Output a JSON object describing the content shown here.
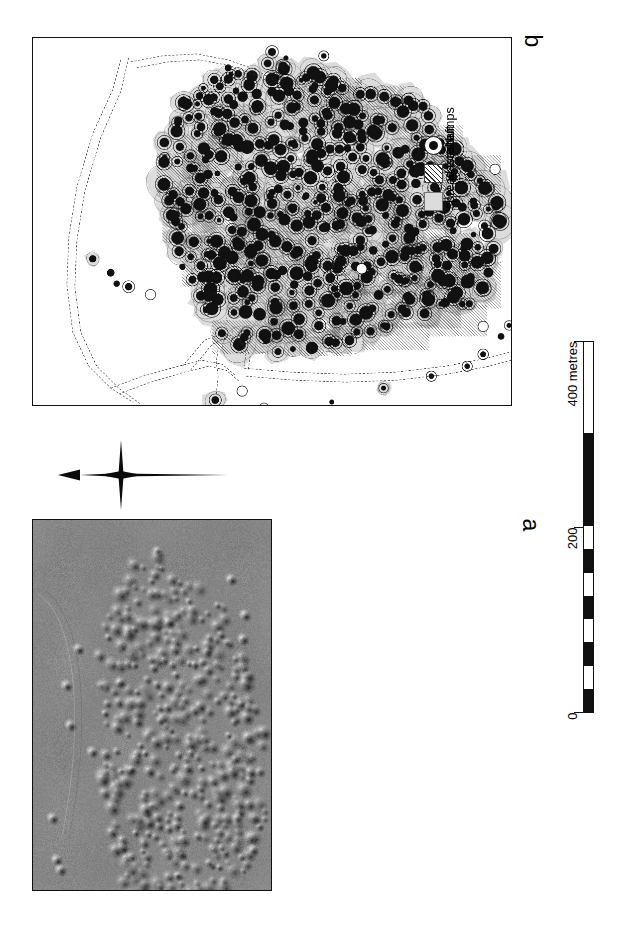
{
  "figure": {
    "panels": [
      {
        "id": "b",
        "letter": "b",
        "type": "archaeological-plan"
      },
      {
        "id": "a",
        "letter": "a",
        "type": "aerial-photograph"
      }
    ]
  },
  "legend": {
    "items": [
      {
        "label": "shaft",
        "symbol": "circle-with-black-dot"
      },
      {
        "label": "waste dumps",
        "symbol": "hatched-square"
      },
      {
        "label": "spread waste",
        "symbol": "grey-square"
      }
    ]
  },
  "scalebar": {
    "ticks": [
      {
        "value": "0",
        "position_m": 0
      },
      {
        "value": "200",
        "position_m": 200
      },
      {
        "value": "400 metres",
        "position_m": 400
      }
    ],
    "range_m": [
      0,
      400
    ],
    "minor_division_m": 25,
    "major_division_m": 100
  },
  "north_arrow": {
    "label": "",
    "points": "north"
  },
  "colors": {
    "ink": "#111111",
    "spread_waste": "#dcdcdc",
    "waste_dump_hatch": "#2b2b2b",
    "photo_background": "#8f8f8f",
    "frame": "#111111"
  },
  "map_features": {
    "shaft_count_approx": 430,
    "boundary_style": "dashed",
    "description": "dense cluster of mine shafts with spread waste haloes and hatched waste dumps"
  }
}
